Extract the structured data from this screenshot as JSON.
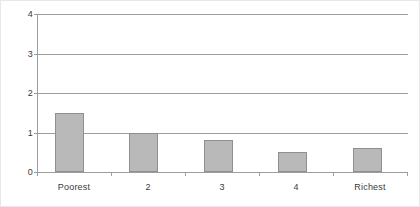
{
  "chart_data": {
    "type": "bar",
    "title": "",
    "subtitle": "",
    "xlabel": "",
    "ylabel": "",
    "categories": [
      "Poorest",
      "2",
      "3",
      "4",
      "Richest"
    ],
    "values": [
      1.5,
      1.0,
      0.8,
      0.5,
      0.62
    ],
    "ylim": [
      0,
      4
    ],
    "y_ticks": [
      "0",
      "1",
      "2",
      "3",
      "4"
    ],
    "y_tick_values": [
      0,
      1,
      2,
      3,
      4
    ],
    "grid": true,
    "grid_axis": "y",
    "legend": false,
    "legend_position": "none",
    "annotations": [],
    "series": [
      {
        "name": "",
        "values": [
          1.5,
          1.0,
          0.8,
          0.5,
          0.62
        ]
      }
    ],
    "colors": {
      "bar_fill": "#b9b9b9",
      "bar_border": "#8f8f8f",
      "grid": "#9d9d9d",
      "axis": "#9d9d9d",
      "text": "#3a3a3a",
      "background": "#ffffff",
      "figure_border": "#e8e8e8"
    }
  }
}
